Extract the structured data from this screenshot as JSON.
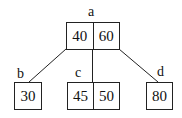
{
  "diagram": {
    "type": "b-tree",
    "nodes": {
      "a": {
        "label": "a",
        "keys": [
          "40",
          "60"
        ]
      },
      "b": {
        "label": "b",
        "keys": [
          "30"
        ]
      },
      "c": {
        "label": "c",
        "keys": [
          "45",
          "50"
        ]
      },
      "d": {
        "label": "d",
        "keys": [
          "80"
        ]
      }
    },
    "edges": [
      {
        "from": "a",
        "to": "b"
      },
      {
        "from": "a",
        "to": "c"
      },
      {
        "from": "a",
        "to": "d"
      }
    ],
    "colors": {
      "stroke": "#222222",
      "background": "#ffffff",
      "text": "#111111"
    }
  }
}
